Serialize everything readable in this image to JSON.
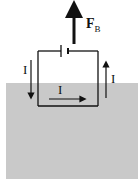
{
  "diagram": {
    "type": "physics-circuit",
    "region": "magnetic-field-region",
    "labels": {
      "force": "F",
      "force_sub": "B",
      "current_left": "I",
      "current_bottom": "I",
      "current_right": "I"
    },
    "colors": {
      "field": "#c9c9c9",
      "line": "#111111"
    }
  }
}
